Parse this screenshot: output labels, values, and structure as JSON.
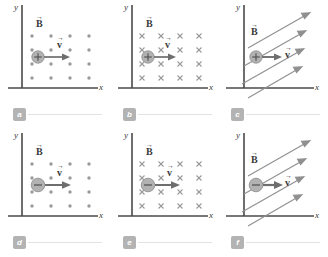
{
  "figure": {
    "columns": 3,
    "rows": 2,
    "colors": {
      "axis": "#4a4a4a",
      "field": "#9a9a9a",
      "charge_fill": "#b0b0b0",
      "charge_stroke": "#7a7a7a",
      "vector": "#6e6e6e",
      "badge_bg": "#b3b3b3",
      "badge_text": "#ffffff",
      "rail": "#e2e2e2",
      "label_text": "#3a3a3a"
    },
    "axis_labels": {
      "x": "x",
      "y": "y"
    },
    "vector_labels": {
      "b": "B",
      "v": "v",
      "arrow_glyph": "→"
    }
  },
  "panels": [
    {
      "id": "a",
      "badge": "a",
      "field_type": "out-of-page",
      "field_symbol": "•",
      "field_rows": 4,
      "field_cols": 4,
      "charge_sign": "+",
      "charge_label": "positive-charge",
      "velocity_direction": "right",
      "b_label": "B",
      "v_label": "v",
      "x_axis_label": "x",
      "y_axis_label": "y"
    },
    {
      "id": "b",
      "badge": "b",
      "field_type": "into-page",
      "field_symbol": "×",
      "field_rows": 4,
      "field_cols": 4,
      "charge_sign": "+",
      "charge_label": "positive-charge",
      "velocity_direction": "right",
      "b_label": "B",
      "v_label": "v",
      "x_axis_label": "x",
      "y_axis_label": "y"
    },
    {
      "id": "c",
      "badge": "c",
      "field_type": "in-plane-diagonal",
      "field_symbol": "↗",
      "field_lines": 4,
      "field_line_angle_deg": 30,
      "charge_sign": "+",
      "charge_label": "positive-charge",
      "velocity_direction": "right",
      "b_label": "B",
      "v_label": "v",
      "x_axis_label": "x",
      "y_axis_label": "y"
    },
    {
      "id": "d",
      "badge": "d",
      "field_type": "out-of-page",
      "field_symbol": "•",
      "field_rows": 4,
      "field_cols": 4,
      "charge_sign": "−",
      "charge_label": "negative-charge",
      "velocity_direction": "right",
      "b_label": "B",
      "v_label": "v",
      "x_axis_label": "x",
      "y_axis_label": "y"
    },
    {
      "id": "e",
      "badge": "e",
      "field_type": "into-page",
      "field_symbol": "×",
      "field_rows": 4,
      "field_cols": 4,
      "charge_sign": "−",
      "charge_label": "negative-charge",
      "velocity_direction": "right",
      "b_label": "B",
      "v_label": "v",
      "x_axis_label": "x",
      "y_axis_label": "y"
    },
    {
      "id": "f",
      "badge": "f",
      "field_type": "in-plane-diagonal",
      "field_symbol": "↗",
      "field_lines": 4,
      "field_line_angle_deg": 30,
      "charge_sign": "−",
      "charge_label": "negative-charge",
      "velocity_direction": "right",
      "b_label": "B",
      "v_label": "v",
      "x_axis_label": "x",
      "y_axis_label": "y"
    }
  ]
}
